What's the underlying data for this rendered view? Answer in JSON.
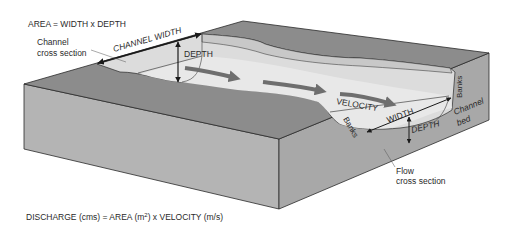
{
  "diagram": {
    "title_formula": "AREA = WIDTH x DEPTH",
    "discharge_formula": {
      "prefix": "DISCHARGE (cms) = AREA (m",
      "superscript": "2",
      "suffix": ") x VELOCITY (m/s)"
    },
    "labels": {
      "channel_cross_section_line1": "Channel",
      "channel_cross_section_line2": "cross section",
      "channel_width": "CHANNEL WIDTH",
      "depth_upper": "DEPTH",
      "velocity": "VELOCITY",
      "width_lower": "WIDTH",
      "depth_lower": "DEPTH",
      "banks_right": "Banks",
      "banks_left": "Banks",
      "channel_bed_line1": "Channel",
      "channel_bed_line2": "bed",
      "flow_cross_section_line1": "Flow",
      "flow_cross_section_line2": "cross section"
    },
    "colors": {
      "top_surface": "#8c8c8c",
      "front_face": "#b4b4b4",
      "side_face": "#a8a8a8",
      "channel_fill": "#dcdcdc",
      "water_fill": "#e8e8e8",
      "arrow_gray": "#6e6e6e",
      "line": "#2a2a2a"
    }
  }
}
